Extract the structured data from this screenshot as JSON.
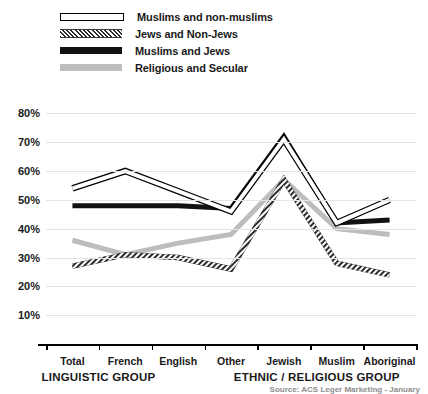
{
  "legend": {
    "items": [
      {
        "label": "Muslims and non-muslims",
        "style": "hollow",
        "icon": "line-swatch-hollow-icon"
      },
      {
        "label": "Jews and Non-Jews",
        "style": "hatch",
        "icon": "line-swatch-hatched-icon"
      },
      {
        "label": "Muslims and Jews",
        "style": "solid",
        "icon": "line-swatch-solid-black-icon"
      },
      {
        "label": "Religious and Secular",
        "style": "gray",
        "icon": "line-swatch-gray-icon"
      }
    ]
  },
  "axis": {
    "yticks": [
      "80%",
      "70%",
      "60%",
      "50%",
      "40%",
      "30%",
      "20%",
      "10%"
    ],
    "ytick_values": [
      80,
      70,
      60,
      50,
      40,
      30,
      20,
      10
    ]
  },
  "groups": [
    {
      "title": "LINGUISTIC GROUP",
      "center_pct": 23
    },
    {
      "title": "ETHNIC / RELIGIOUS GROUP",
      "center_pct": 74
    }
  ],
  "source": "Source: ACS Leger Marketing - January",
  "chart_data": {
    "type": "line",
    "title": "",
    "xlabel": "",
    "ylabel": "",
    "ylim": [
      0,
      85
    ],
    "grid": true,
    "legend_position": "top-left",
    "categories": [
      "Total",
      "French",
      "English",
      "Other",
      "Jewish",
      "Muslim",
      "Aboriginal"
    ],
    "series": [
      {
        "name": "Muslims and non-muslims",
        "color": "#ffffff",
        "stroke": "#000000",
        "values": [
          54,
          60,
          53,
          46,
          71,
          42,
          50
        ]
      },
      {
        "name": "Jews and Non-Jews",
        "color": "#3a3a3a",
        "stroke": "#3a3a3a",
        "values": [
          27,
          31,
          30,
          26,
          57,
          28,
          24
        ]
      },
      {
        "name": "Muslims and Jews",
        "color": "#111111",
        "stroke": "#111111",
        "values": [
          48,
          48,
          48,
          47,
          72,
          42,
          43
        ]
      },
      {
        "name": "Religious and Secular",
        "color": "#bdbdbd",
        "stroke": "#bdbdbd",
        "values": [
          36,
          31,
          35,
          38,
          57,
          40,
          38
        ]
      }
    ]
  }
}
